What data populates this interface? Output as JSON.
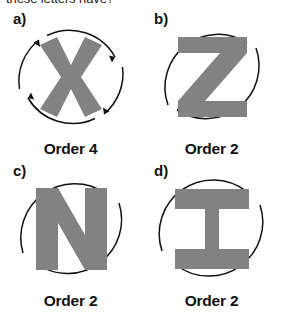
{
  "question": {
    "text": "these letters have?"
  },
  "panels": [
    {
      "id": "a",
      "marker": "a)",
      "letter": "X",
      "letter_name": "letter-x",
      "order_label": "Order 4",
      "order_value": 4,
      "arrow_count": 4,
      "letter_color": "#828282"
    },
    {
      "id": "b",
      "marker": "b)",
      "letter": "Z",
      "letter_name": "letter-z",
      "order_label": "Order 2",
      "order_value": 2,
      "arrow_count": 2,
      "letter_color": "#828282"
    },
    {
      "id": "c",
      "marker": "c)",
      "letter": "N",
      "letter_name": "letter-n",
      "order_label": "Order 2",
      "order_value": 2,
      "arrow_count": 2,
      "letter_color": "#828282"
    },
    {
      "id": "d",
      "marker": "d)",
      "letter": "I",
      "letter_name": "letter-i",
      "order_label": "Order 2",
      "order_value": 2,
      "arrow_count": 2,
      "letter_color": "#828282"
    }
  ],
  "colors": {
    "background": "#ffffff",
    "ink": "#111111",
    "letter_gray": "#828282"
  }
}
